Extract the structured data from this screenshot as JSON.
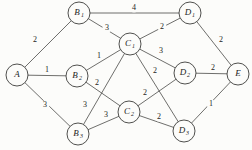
{
  "figure": {
    "background_color": "#fcfcfa",
    "stroke_color": "#4a4a48",
    "text_color": "#1c1c1c",
    "width": 252,
    "height": 150
  },
  "chart_data": {
    "type": "diagram",
    "diagram_kind": "weighted-undirected-graph",
    "title": "",
    "nodes": [
      {
        "id": "A",
        "base": "A",
        "sub": "",
        "x": 17,
        "y": 75,
        "r": 11
      },
      {
        "id": "B1",
        "base": "B",
        "sub": "1",
        "x": 79,
        "y": 13,
        "r": 11
      },
      {
        "id": "B2",
        "base": "B",
        "sub": "2",
        "x": 77,
        "y": 76,
        "r": 11
      },
      {
        "id": "B3",
        "base": "B",
        "sub": "3",
        "x": 78,
        "y": 134,
        "r": 11
      },
      {
        "id": "C1",
        "base": "C",
        "sub": "1",
        "x": 130,
        "y": 44,
        "r": 11
      },
      {
        "id": "C2",
        "base": "C",
        "sub": "2",
        "x": 129,
        "y": 112,
        "r": 11
      },
      {
        "id": "D1",
        "base": "D",
        "sub": "1",
        "x": 190,
        "y": 13,
        "r": 11
      },
      {
        "id": "D2",
        "base": "D",
        "sub": "2",
        "x": 185,
        "y": 73,
        "r": 11
      },
      {
        "id": "D3",
        "base": "D",
        "sub": "3",
        "x": 184,
        "y": 131,
        "r": 11
      },
      {
        "id": "E",
        "base": "E",
        "sub": "",
        "x": 238,
        "y": 74,
        "r": 11
      }
    ],
    "edges": [
      {
        "from": "A",
        "to": "B1",
        "weight": "2",
        "lx": 35,
        "ly": 40
      },
      {
        "from": "A",
        "to": "B2",
        "weight": "1",
        "lx": 47,
        "ly": 70
      },
      {
        "from": "A",
        "to": "B3",
        "weight": "3",
        "lx": 45,
        "ly": 105
      },
      {
        "from": "B1",
        "to": "D1",
        "weight": "4",
        "lx": 134,
        "ly": 8
      },
      {
        "from": "B1",
        "to": "C1",
        "weight": "3",
        "lx": 107,
        "ly": 28
      },
      {
        "from": "C1",
        "to": "D1",
        "weight": "2",
        "lx": 162,
        "ly": 27
      },
      {
        "from": "D1",
        "to": "E",
        "weight": "2",
        "lx": 221,
        "ly": 40
      },
      {
        "from": "B2",
        "to": "C1",
        "weight": "1",
        "lx": 99,
        "ly": 56
      },
      {
        "from": "C1",
        "to": "D2",
        "weight": "3",
        "lx": 161,
        "ly": 51
      },
      {
        "from": "D2",
        "to": "E",
        "weight": "2",
        "lx": 213,
        "ly": 68
      },
      {
        "from": "B2",
        "to": "C2",
        "weight": "2",
        "lx": 97,
        "ly": 83
      },
      {
        "from": "C1",
        "to": "B3",
        "weight": "3",
        "lx": 85,
        "ly": 105
      },
      {
        "from": "C1",
        "to": "D3",
        "weight": "2",
        "lx": 155,
        "ly": 71
      },
      {
        "from": "C2",
        "to": "D2",
        "weight": "2",
        "lx": 145,
        "ly": 93
      },
      {
        "from": "B3",
        "to": "C2",
        "weight": "3",
        "lx": 106,
        "ly": 115
      },
      {
        "from": "C2",
        "to": "D3",
        "weight": "2",
        "lx": 159,
        "ly": 117
      },
      {
        "from": "D3",
        "to": "E",
        "weight": "1",
        "lx": 211,
        "ly": 104
      }
    ]
  }
}
